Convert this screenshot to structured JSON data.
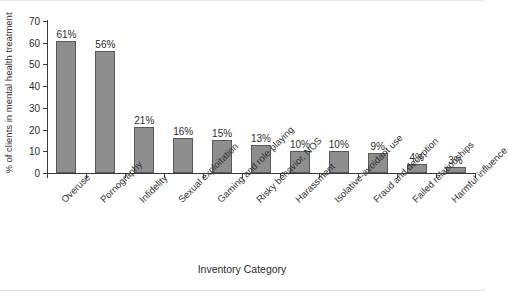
{
  "chart_data": {
    "type": "bar",
    "title": "",
    "xlabel": "Inventory Category",
    "ylabel": "% of clients in mental health treatment",
    "ylim": [
      0,
      70
    ],
    "yticks": [
      0,
      10,
      20,
      30,
      40,
      50,
      60,
      70
    ],
    "grid": false,
    "legend": null,
    "bar_color": "#8e8e8e",
    "bar_edge_color": "#585858",
    "value_label_suffix": "%",
    "categories": [
      "Overuse",
      "Pornography",
      "Infidelity",
      "Sexual exploitation",
      "Gaming and role-playing",
      "Risky behavior, NOS",
      "Harassment",
      "Isolative-avoidant use",
      "Fraud and deception",
      "Failed relationships",
      "Harmful influence"
    ],
    "values": [
      61,
      56,
      21,
      16,
      15,
      13,
      10,
      10,
      9,
      4,
      3
    ],
    "value_labels": [
      "61%",
      "56%",
      "21%",
      "16%",
      "15%",
      "13%",
      "10%",
      "10%",
      "9%",
      "4%",
      "3%"
    ]
  }
}
